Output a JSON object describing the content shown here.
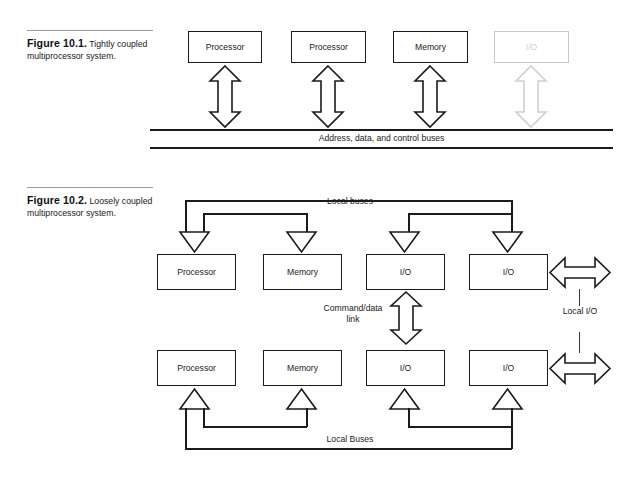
{
  "figures": [
    {
      "id": "figure-10-1",
      "number": "Figure 10.1.",
      "caption": "Tightly coupled multiprocessor system.",
      "nodes": [
        {
          "label": "Processor",
          "faded": false
        },
        {
          "label": "Processor",
          "faded": false
        },
        {
          "label": "Memory",
          "faded": false
        },
        {
          "label": "I/O",
          "faded": true
        }
      ],
      "bus_label": "Address, data, and control buses"
    },
    {
      "id": "figure-10-2",
      "number": "Figure 10.2.",
      "caption": "Loosely coupled multiprocessor system.",
      "top_bus_label": "Local buses",
      "bottom_bus_label": "Local Buses",
      "link_label": "Command/data link",
      "local_io_label": "Local I/O",
      "top_nodes": [
        {
          "label": "Processor"
        },
        {
          "label": "Memory"
        },
        {
          "label": "I/O"
        },
        {
          "label": "I/O"
        }
      ],
      "bottom_nodes": [
        {
          "label": "Processor"
        },
        {
          "label": "Memory"
        },
        {
          "label": "I/O"
        },
        {
          "label": "I/O"
        }
      ]
    }
  ],
  "colors": {
    "ink": "#1b1b1b",
    "faded_ink": "#cfcfcf",
    "page": "#fefefe",
    "rule": "#9a9a9a"
  }
}
